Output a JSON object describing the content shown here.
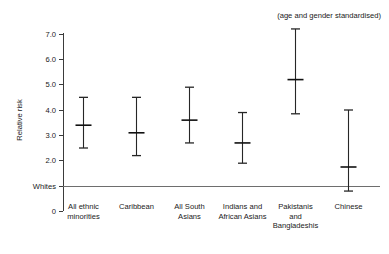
{
  "chart_data": {
    "type": "scatter",
    "title": "",
    "annotation": "(age and gender standardised)",
    "xlabel": "",
    "ylabel": "Relative risk",
    "ylim": [
      0,
      7.6
    ],
    "grid": false,
    "legend": "none",
    "y_ticks": [
      {
        "value": 7.0,
        "label": "7.0"
      },
      {
        "value": 6.0,
        "label": "6.0"
      },
      {
        "value": 5.0,
        "label": "5.0"
      },
      {
        "value": 4.0,
        "label": "4.0"
      },
      {
        "value": 3.0,
        "label": "3.0"
      },
      {
        "value": 2.0,
        "label": "2.0"
      },
      {
        "value": 1.0,
        "label": "Whites"
      },
      {
        "value": 0.0,
        "label": "0"
      }
    ],
    "reference_line": {
      "value": 1.0,
      "label": "Whites"
    },
    "categories": [
      "All ethnic minorities",
      "Caribbean",
      "All South Asians",
      "Indians and African Asians",
      "Pakistanis and Bangladeshis",
      "Chinese"
    ],
    "category_label_lines": [
      [
        "All ethnic",
        "minorities"
      ],
      [
        "Caribbean"
      ],
      [
        "All South",
        "Asians"
      ],
      [
        "Indians and",
        "African Asians"
      ],
      [
        "Pakistanis",
        "and",
        "Bangladeshis"
      ],
      [
        "Chinese"
      ]
    ],
    "points": [
      {
        "category": "All ethnic minorities",
        "value": 3.4,
        "low": 2.5,
        "high": 4.5
      },
      {
        "category": "Caribbean",
        "value": 3.1,
        "low": 2.2,
        "high": 4.5
      },
      {
        "category": "All South Asians",
        "value": 3.6,
        "low": 2.7,
        "high": 4.9
      },
      {
        "category": "Indians and African Asians",
        "value": 2.7,
        "low": 1.9,
        "high": 3.9
      },
      {
        "category": "Pakistanis and Bangladeshis",
        "value": 5.2,
        "low": 3.85,
        "high": 7.2
      },
      {
        "category": "Chinese",
        "value": 1.75,
        "low": 0.8,
        "high": 4.0
      }
    ],
    "series_note": "point estimate with 95% confidence interval whiskers"
  },
  "colors": {
    "axis": "#3b3b3b",
    "reference_line": "#6e6e6e",
    "marker": "#262626",
    "text": "#1a1a1a",
    "background": "#ffffff"
  }
}
